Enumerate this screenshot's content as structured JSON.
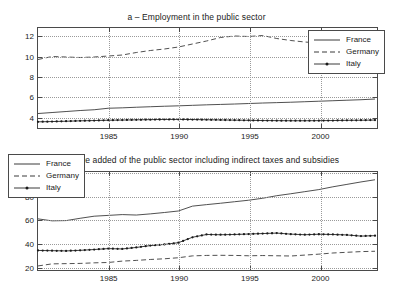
{
  "figure": {
    "background": "#ffffff",
    "line_color": "#3a3a3a",
    "axis_color": "#4a4a4a",
    "grid_color": "#9a9a9a"
  },
  "chart_data": [
    {
      "id": "panel_a",
      "type": "line",
      "title": "a – Employment in the public sector",
      "xlabel": "",
      "ylabel": "",
      "xlim": [
        1980,
        2004
      ],
      "ylim": [
        3.0,
        12.8
      ],
      "xticks": [
        1985,
        1990,
        1995,
        2000
      ],
      "xtick_labels": [
        "1985",
        "1990",
        "1995",
        "2000"
      ],
      "yticks": [
        4,
        6,
        8,
        10,
        12
      ],
      "ytick_labels": [
        "4",
        "6",
        "8",
        "10",
        "12"
      ],
      "grid": true,
      "legend_position": "right",
      "x": [
        1980,
        1981,
        1982,
        1983,
        1984,
        1985,
        1986,
        1987,
        1988,
        1989,
        1990,
        1991,
        1992,
        1993,
        1994,
        1995,
        1996,
        1997,
        1998,
        1999,
        2000,
        2001,
        2002,
        2003,
        2004
      ],
      "series": [
        {
          "name": "France",
          "style": "solid",
          "marker": "none",
          "values": [
            4.25,
            4.35,
            4.45,
            4.55,
            4.63,
            4.78,
            4.82,
            4.88,
            4.93,
            4.98,
            5.02,
            5.07,
            5.12,
            5.16,
            5.2,
            5.25,
            5.3,
            5.34,
            5.38,
            5.43,
            5.48,
            5.53,
            5.58,
            5.63,
            5.7
          ]
        },
        {
          "name": "Germany",
          "style": "dashed",
          "marker": "none",
          "values": [
            9.65,
            9.95,
            9.9,
            9.85,
            9.9,
            10.0,
            10.1,
            10.35,
            10.55,
            10.7,
            10.9,
            11.2,
            11.5,
            11.85,
            12.0,
            11.95,
            12.05,
            11.75,
            11.55,
            11.4,
            11.3,
            11.25,
            11.05,
            10.95,
            10.8
          ]
        },
        {
          "name": "Italy",
          "style": "solid",
          "marker": "dot",
          "values": [
            3.42,
            3.45,
            3.48,
            3.52,
            3.55,
            3.58,
            3.6,
            3.62,
            3.64,
            3.66,
            3.66,
            3.65,
            3.63,
            3.61,
            3.59,
            3.57,
            3.55,
            3.54,
            3.53,
            3.53,
            3.54,
            3.55,
            3.57,
            3.58,
            3.6
          ]
        }
      ]
    },
    {
      "id": "panel_b",
      "type": "line",
      "title": "b – Value added of the public sector including indirect taxes and subsidies",
      "xlabel": "",
      "ylabel": "",
      "xlim": [
        1980,
        2004
      ],
      "ylim": [
        18,
        101
      ],
      "xticks": [
        1985,
        1990,
        1995,
        2000
      ],
      "xtick_labels": [
        "1985",
        "1990",
        "1995",
        "2000"
      ],
      "yticks": [
        20,
        40,
        60,
        80,
        100
      ],
      "ytick_labels": [
        "20",
        "40",
        "60",
        "80",
        "100"
      ],
      "grid": true,
      "legend_position": "left",
      "x": [
        1980,
        1981,
        1982,
        1983,
        1984,
        1985,
        1986,
        1987,
        1988,
        1989,
        1990,
        1991,
        1992,
        1993,
        1994,
        1995,
        1996,
        1997,
        1998,
        1999,
        2000,
        2001,
        2002,
        2003,
        2004
      ],
      "series": [
        {
          "name": "France",
          "style": "solid",
          "marker": "none",
          "values": [
            60.5,
            58.8,
            59.0,
            61.0,
            62.8,
            63.5,
            64.2,
            63.8,
            64.8,
            66.0,
            67.3,
            71.5,
            72.8,
            74.0,
            75.3,
            76.6,
            78.3,
            80.5,
            82.2,
            84.0,
            85.8,
            88.2,
            90.3,
            92.4,
            94.3
          ]
        },
        {
          "name": "Germany",
          "style": "dashed",
          "marker": "none",
          "values": [
            19.8,
            21.6,
            21.8,
            22.0,
            22.5,
            22.8,
            24.0,
            24.6,
            25.4,
            26.0,
            26.9,
            28.5,
            28.9,
            29.0,
            28.9,
            28.6,
            28.8,
            28.6,
            28.4,
            29.2,
            30.0,
            31.0,
            31.6,
            32.2,
            32.5
          ]
        },
        {
          "name": "Italy",
          "style": "solid",
          "marker": "dot",
          "values": [
            33.2,
            33.0,
            32.8,
            33.3,
            34.0,
            34.8,
            34.5,
            35.8,
            37.4,
            38.4,
            39.9,
            44.6,
            47.0,
            46.8,
            47.0,
            47.4,
            47.8,
            48.2,
            47.3,
            46.8,
            47.2,
            47.0,
            46.6,
            45.6,
            46.0
          ]
        }
      ]
    }
  ]
}
